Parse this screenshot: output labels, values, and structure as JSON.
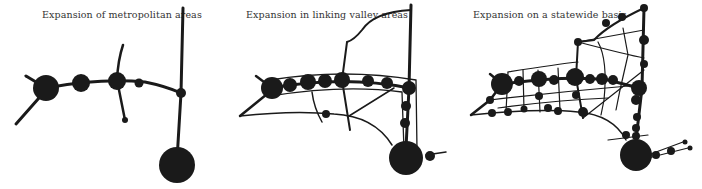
{
  "panels": [
    {
      "id": "metropolitan",
      "caption": "Expansion of metropolitan areas"
    },
    {
      "id": "valley",
      "caption": "Expansion in linking valley areas"
    },
    {
      "id": "statewide",
      "caption": "Expansion on a statewide basis"
    }
  ],
  "colors": {
    "ink": "#1a1a1a",
    "background": "#ffffff"
  }
}
